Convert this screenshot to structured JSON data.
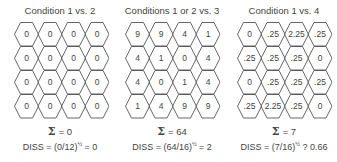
{
  "panels": [
    {
      "title": "Condition 1 vs. 2",
      "cells": [
        [
          "0",
          "0",
          "0",
          "0"
        ],
        [
          "0",
          "0",
          "0",
          "0"
        ],
        [
          "0",
          "0",
          "0",
          "0"
        ],
        [
          "0",
          "0",
          "0",
          "0"
        ]
      ],
      "sum_symbol": "Σ",
      "sum_text": "= 0",
      "diss_prefix": "DISS = (0/12)",
      "diss_exponent": "½",
      "diss_suffix": " = 0"
    },
    {
      "title": "Conditions 1 or 2 vs. 3",
      "cells": [
        [
          "9",
          "9",
          "4",
          "1"
        ],
        [
          "4",
          "1",
          "0",
          "4"
        ],
        [
          "4",
          "0",
          "1",
          "4"
        ],
        [
          "1",
          "4",
          "9",
          "9"
        ]
      ],
      "sum_symbol": "Σ",
      "sum_text": "= 64",
      "diss_prefix": "DISS = (64/16)",
      "diss_exponent": "½",
      "diss_suffix": " = 2"
    },
    {
      "title": "Condition 1 vs. 4",
      "cells": [
        [
          "0",
          ".25",
          "2.25",
          ".25"
        ],
        [
          ".25",
          ".25",
          ".25",
          "0"
        ],
        [
          "0",
          ".25",
          ".25",
          ".25"
        ],
        [
          ".25",
          "2.25",
          ".25",
          "0"
        ]
      ],
      "sum_symbol": "Σ",
      "sum_text": "= 7",
      "diss_prefix": "DISS = (7/16)",
      "diss_exponent": "½",
      "diss_suffix": " ? 0.66"
    }
  ],
  "colors": {
    "stroke": "#555555",
    "text": "#444444",
    "background": "#ffffff"
  }
}
